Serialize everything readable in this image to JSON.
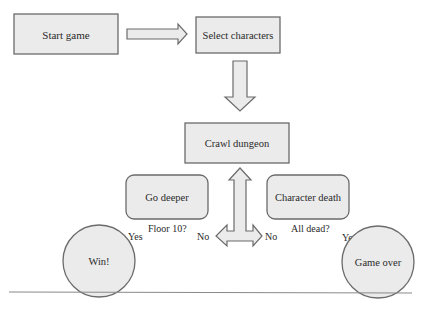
{
  "diagram": {
    "type": "flowchart",
    "colors": {
      "fill": "#ebebeb",
      "stroke": "#6b6b6b",
      "text": "#2a2a2a",
      "rule": "#8a8a8a"
    },
    "nodes": {
      "start": {
        "label": "Start game",
        "shape": "rectangle"
      },
      "select": {
        "label": "Select characters",
        "shape": "rectangle"
      },
      "crawl": {
        "label": "Crawl dungeon",
        "shape": "rectangle"
      },
      "deeper": {
        "label": "Go deeper",
        "shape": "rounded-rectangle"
      },
      "death": {
        "label": "Character death",
        "shape": "rounded-rectangle"
      },
      "win": {
        "label": "Win!",
        "shape": "circle"
      },
      "gameover": {
        "label": "Game over",
        "shape": "circle"
      }
    },
    "edge_labels": {
      "floor_question": "Floor 10?",
      "floor_yes": "Yes",
      "floor_no": "No",
      "dead_question": "All dead?",
      "dead_yes": "Yes",
      "dead_no": "No"
    },
    "edges": [
      {
        "from": "Start game",
        "to": "Select characters"
      },
      {
        "from": "Select characters",
        "to": "Crawl dungeon"
      },
      {
        "from": "Go deeper",
        "to": "Crawl dungeon",
        "condition": "Floor 10? No"
      },
      {
        "from": "Go deeper",
        "to": "Win!",
        "condition": "Floor 10? Yes"
      },
      {
        "from": "Character death",
        "to": "Crawl dungeon",
        "condition": "All dead? No"
      },
      {
        "from": "Character death",
        "to": "Game over",
        "condition": "All dead? Yes"
      }
    ]
  }
}
